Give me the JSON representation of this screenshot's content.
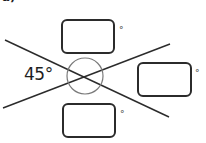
{
  "figure": {
    "part_label": "a)",
    "given_angle_label": "45°",
    "degree_symbol": "°",
    "colors": {
      "line": "#2b2b2b",
      "circle": "#7a7a7a",
      "text": "#1e1e1e"
    },
    "lines": [
      {
        "x1": 5,
        "y1": 40,
        "x2": 169,
        "y2": 117
      },
      {
        "x1": 3,
        "y1": 108,
        "x2": 170,
        "y2": 44
      }
    ],
    "angle_marker_circle": {
      "cx": 85,
      "cy": 76,
      "r": 18
    },
    "answer_boxes": [
      {
        "id": "top",
        "value": "",
        "degree": "°"
      },
      {
        "id": "right",
        "value": "",
        "degree": "°"
      },
      {
        "id": "bottom",
        "value": "",
        "degree": "°"
      }
    ]
  }
}
